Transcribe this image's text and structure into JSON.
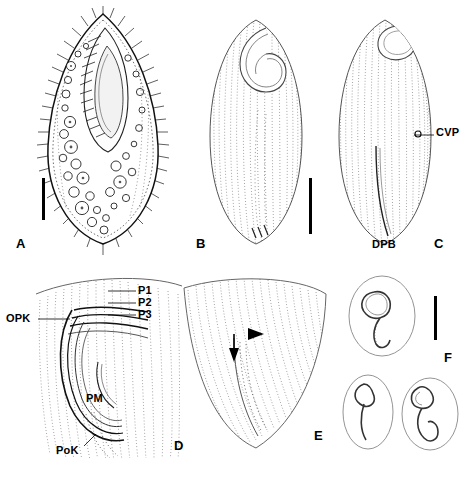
{
  "figure": {
    "caption_visible": false,
    "panels": [
      {
        "id": "A",
        "label": "A",
        "name": "panel-a-whole-cell-ventral-view",
        "description": "Ventral view drawing of ciliate cell with cilia, macronucleus and vacuoles",
        "scalebar": true
      },
      {
        "id": "B",
        "label": "B",
        "name": "panel-b-ventral-infraciliature",
        "description": "Ventral infraciliature silver impregnation drawing",
        "scalebar": true
      },
      {
        "id": "C",
        "label": "C",
        "name": "panel-c-dorsal-infraciliature",
        "description": "Dorsal infraciliature silver impregnation drawing",
        "scalebar": false
      },
      {
        "id": "D",
        "label": "D",
        "name": "panel-d-oral-apparatus",
        "description": "Detail of anterior oral apparatus showing membranelles",
        "scalebar": false
      },
      {
        "id": "E",
        "label": "E",
        "name": "panel-e-posterior-detail",
        "description": "Detail of posterior region with arrow and arrowhead markers",
        "scalebar": false
      },
      {
        "id": "F",
        "label": "F",
        "name": "panel-f-macronuclei",
        "description": "Three variants of macronucleus shape",
        "scalebar": true
      }
    ],
    "annotations": [
      {
        "id": "CVP",
        "text": "CVP",
        "name": "annotation-cvp",
        "panel": "C"
      },
      {
        "id": "DPB",
        "text": "DPB",
        "name": "annotation-dpb",
        "panel": "C"
      },
      {
        "id": "P1",
        "text": "P1",
        "name": "annotation-p1",
        "panel": "D"
      },
      {
        "id": "P2",
        "text": "P2",
        "name": "annotation-p2",
        "panel": "D"
      },
      {
        "id": "P3",
        "text": "P3",
        "name": "annotation-p3",
        "panel": "D"
      },
      {
        "id": "OPK",
        "text": "OPK",
        "name": "annotation-opk",
        "panel": "D"
      },
      {
        "id": "PM",
        "text": "PM",
        "name": "annotation-pm",
        "panel": "D"
      },
      {
        "id": "PoK",
        "text": "PoK",
        "name": "annotation-pok",
        "panel": "D"
      }
    ],
    "watermark": {
      "text": "",
      "name": "watermark-bottom-right"
    }
  }
}
